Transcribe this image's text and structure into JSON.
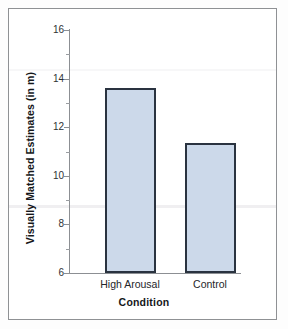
{
  "chart_data": {
    "type": "bar",
    "title": "",
    "categories": [
      "High Arousal",
      "Control"
    ],
    "values": [
      13.6,
      11.35
    ],
    "xlabel": "Condition",
    "ylabel": "Visually Matched Estimates (in m)",
    "ylim": [
      6,
      16
    ],
    "ytick_labels": [
      "6",
      "8",
      "10",
      "12",
      "14",
      "16"
    ],
    "ytick_values": [
      6,
      8,
      10,
      12,
      14,
      16
    ],
    "yminor_values": [
      7,
      9,
      11,
      13,
      15
    ],
    "grid": false,
    "legend": null,
    "bar_fill_color": "#ccd9ea",
    "bar_border_color": "#2a3340",
    "axis_color": "#8c8f93",
    "frame_color": "#8f9194",
    "background_color": "#ffffff"
  }
}
